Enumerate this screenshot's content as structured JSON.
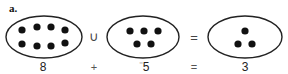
{
  "problem_label": "a.",
  "sets": [
    {
      "name": "left-set",
      "count": 8,
      "cx": 44,
      "cy": 37,
      "rx": 38,
      "ry": 21,
      "dots": [
        [
          22,
          30
        ],
        [
          37,
          27
        ],
        [
          51,
          27
        ],
        [
          65,
          30
        ],
        [
          22,
          44
        ],
        [
          37,
          46
        ],
        [
          51,
          46
        ],
        [
          65,
          43
        ]
      ]
    },
    {
      "name": "middle-set",
      "count": 5,
      "cx": 143,
      "cy": 37,
      "rx": 36,
      "ry": 21,
      "dots": [
        [
          130,
          31
        ],
        [
          144,
          31
        ],
        [
          158,
          31
        ],
        [
          137,
          44
        ],
        [
          151,
          44
        ]
      ]
    },
    {
      "name": "right-set",
      "count": 3,
      "cx": 245,
      "cy": 37,
      "rx": 37,
      "ry": 21,
      "dots": [
        [
          245,
          31
        ],
        [
          238,
          44
        ],
        [
          252,
          44
        ]
      ]
    }
  ],
  "set_operators": {
    "union": "∪",
    "equals": "="
  },
  "equation": {
    "term1": "8",
    "plus": "+",
    "term2_sign": "⁻",
    "term2_value": "5",
    "equals": "=",
    "result": "3"
  },
  "colors": {
    "stroke": "#222222",
    "dot": "#111111"
  }
}
